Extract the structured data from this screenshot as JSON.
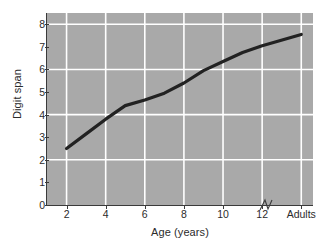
{
  "chart_data": {
    "type": "line",
    "title": "",
    "xlabel": "Age (years)",
    "ylabel": "Digit span",
    "x_tick_labels": [
      "2",
      "4",
      "6",
      "8",
      "10",
      "12",
      "Adults"
    ],
    "x_tick_values": [
      2,
      4,
      6,
      8,
      10,
      12,
      14
    ],
    "y_tick_labels": [
      "0",
      "1",
      "2",
      "3",
      "4",
      "5",
      "6",
      "7",
      "8"
    ],
    "y_tick_values": [
      0,
      1,
      2,
      3,
      4,
      5,
      6,
      7,
      8
    ],
    "ylim": [
      0,
      8.5
    ],
    "xlim": [
      1,
      14.6
    ],
    "grid": "major gridlines, white, on gray panel",
    "axis_break": "zigzag break on x-axis between age 12 and Adults",
    "legend": "none",
    "series": [
      {
        "name": "Digit span by age",
        "x": [
          2,
          3,
          4,
          5,
          6,
          7,
          8,
          9,
          10,
          11,
          12,
          14
        ],
        "values": [
          2.5,
          3.15,
          3.8,
          4.4,
          4.65,
          4.95,
          5.4,
          5.95,
          6.35,
          6.75,
          7.05,
          7.55
        ],
        "x_labels": [
          "2",
          "3",
          "4",
          "5",
          "6",
          "7",
          "8",
          "9",
          "10",
          "11",
          "12",
          "Adults"
        ],
        "color": "#222222",
        "line_width": 3.2,
        "markers": "none"
      }
    ],
    "panel_background": "#a9a9a9",
    "gridline_color": "#ffffff",
    "axis_color": "#3a3a3a"
  }
}
